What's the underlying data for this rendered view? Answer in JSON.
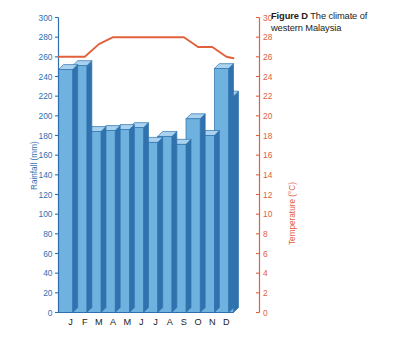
{
  "figure": {
    "label": "Figure D",
    "caption": "The climate of western Malaysia"
  },
  "colors": {
    "bar_face": "#6fb2e0",
    "bar_top": "#a8d2ef",
    "bar_side": "#2f72ad",
    "bar_outline": "#2f72ad",
    "temperature_line": "#e2603c",
    "left_axis": "#2f6fb0",
    "right_axis": "#e2603c",
    "text": "#1b1b1b",
    "background": "#ffffff"
  },
  "chart_data": {
    "type": "bar",
    "title": "Figure D  The climate of western Malaysia",
    "xlabel": "",
    "ylabel": "Rainfall (mm)",
    "y2label": "Temperature (°C)",
    "categories": [
      "J",
      "F",
      "M",
      "A",
      "M",
      "J",
      "J",
      "A",
      "S",
      "O",
      "N",
      "D"
    ],
    "month_names": [
      "January",
      "February",
      "March",
      "April",
      "May",
      "June",
      "July",
      "August",
      "September",
      "October",
      "November",
      "December"
    ],
    "grid": false,
    "legend": "none",
    "ylim": [
      0,
      300
    ],
    "y_ticks": [
      0,
      20,
      40,
      60,
      80,
      100,
      120,
      140,
      160,
      180,
      200,
      220,
      240,
      260,
      280,
      300
    ],
    "y2lim": [
      0,
      30
    ],
    "y2_ticks": [
      0,
      2,
      4,
      6,
      8,
      10,
      12,
      14,
      16,
      18,
      20,
      22,
      24,
      26,
      28,
      30
    ],
    "series": [
      {
        "name": "Rainfall (mm)",
        "type": "bar",
        "axis": "left",
        "unit": "mm",
        "values": [
          247,
          251,
          184,
          185,
          186,
          188,
          173,
          179,
          171,
          197,
          180,
          248
        ]
      },
      {
        "name": "Temperature (°C)",
        "type": "line",
        "axis": "right",
        "unit": "°C",
        "values": [
          26,
          26,
          27.3,
          28,
          28,
          28,
          28,
          28,
          28,
          27,
          27,
          26
        ]
      }
    ],
    "extra_bar": {
      "note": "A thirteenth partial bar is drawn at the right edge of the plot",
      "value": 220
    }
  },
  "axes": {
    "left": {
      "title": "Rainfall (mm)",
      "tick_labels": [
        "300",
        "280",
        "260",
        "240",
        "220",
        "200",
        "180",
        "160",
        "140",
        "120",
        "100",
        "80",
        "60",
        "40",
        "20",
        "0"
      ]
    },
    "right": {
      "title": "Temperature (°C)",
      "tick_labels": [
        "30",
        "28",
        "26",
        "24",
        "22",
        "20",
        "18",
        "16",
        "14",
        "12",
        "10",
        "8",
        "6",
        "4",
        "2",
        "0"
      ]
    },
    "bottom": {
      "tick_labels": [
        "J",
        "F",
        "M",
        "A",
        "M",
        "J",
        "J",
        "A",
        "S",
        "O",
        "N",
        "D"
      ]
    }
  }
}
